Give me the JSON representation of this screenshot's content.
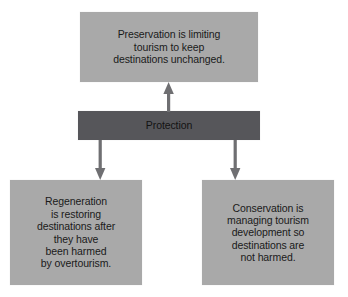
{
  "diagram": {
    "type": "flowchart",
    "colors": {
      "node_light_fill": "#a9a9a9",
      "node_dark_fill": "#56565a",
      "arrow": "#6f6f72",
      "text": "#1a1a1a",
      "background": "#ffffff"
    },
    "nodes": [
      {
        "id": "protection",
        "label": "Protection",
        "style": "dark",
        "role": "root"
      },
      {
        "id": "preservation",
        "label": "Preservation is limiting\ntourism to keep\ndestinations unchanged.",
        "style": "light",
        "role": "branch"
      },
      {
        "id": "regeneration",
        "label": "Regeneration\nis restoring\ndestinations after\nthey have\nbeen harmed\nby overtourism.",
        "style": "light",
        "role": "branch"
      },
      {
        "id": "conservation",
        "label": "Conservation is\nmanaging tourism\ndevelopment so\ndestinations are\nnot harmed.",
        "style": "light",
        "role": "branch"
      }
    ],
    "edges": [
      {
        "id": "edge-up",
        "from": "protection",
        "to": "preservation",
        "direction": "up"
      },
      {
        "id": "edge-down-left",
        "from": "protection",
        "to": "regeneration",
        "direction": "down"
      },
      {
        "id": "edge-down-right",
        "from": "protection",
        "to": "conservation",
        "direction": "down"
      }
    ]
  }
}
